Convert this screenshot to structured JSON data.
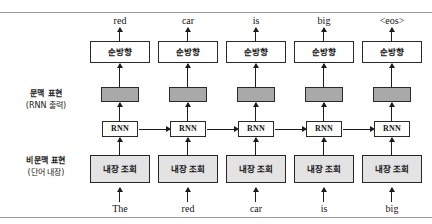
{
  "figure": {
    "title": "",
    "type": "neural-network-architecture-diagram",
    "colors": {
      "context_box_fill": "#a9a9a9",
      "embedding_box_fill": "#e3e3e3",
      "forward_box_fill": "#ffffff",
      "rnn_box_fill": "#ffffff",
      "stroke": "#2a2a2a",
      "rule": "#9b9b9b",
      "background": "#ffffff"
    }
  },
  "row_labels": {
    "context": {
      "main": "문맥 표현",
      "sub": "(RNN 출력)"
    },
    "noncontext": {
      "main": "비문맥 표현",
      "sub": "(단어 내장)"
    }
  },
  "box_labels": {
    "forward": "순방향",
    "rnn": "RNN",
    "embedding": "내장 조회"
  },
  "columns": [
    {
      "input": "The",
      "output": "red",
      "forward": "순방향",
      "rnn": "RNN",
      "embedding": "내장 조회"
    },
    {
      "input": "red",
      "output": "car",
      "forward": "순방향",
      "rnn": "RNN",
      "embedding": "내장 조회"
    },
    {
      "input": "car",
      "output": "is",
      "forward": "순방향",
      "rnn": "RNN",
      "embedding": "내장 조회"
    },
    {
      "input": "is",
      "output": "big",
      "forward": "순방향",
      "rnn": "RNN",
      "embedding": "내장 조회"
    },
    {
      "input": "big",
      "output": "<eos>",
      "forward": "순방향",
      "rnn": "RNN",
      "embedding": "내장 조회"
    }
  ]
}
